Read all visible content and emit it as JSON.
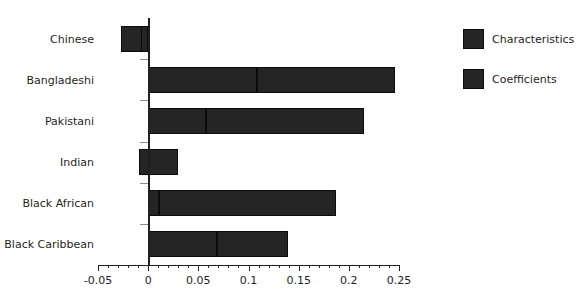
{
  "chart_data": {
    "type": "bar",
    "orientation": "horizontal",
    "stacked": true,
    "title": "",
    "xlabel": "",
    "ylabel": "",
    "xlim": [
      -0.05,
      0.25
    ],
    "grid": false,
    "categories": [
      "Chinese",
      "Bangladeshi",
      "Pakistani",
      "Indian",
      "Black African",
      "Black Caribbean"
    ],
    "xticks": [
      -0.05,
      0,
      0.05,
      0.1,
      0.15,
      0.2,
      0.25
    ],
    "xticklabels": [
      "-0.05",
      "0",
      "0.05",
      "0.1",
      "0.15",
      "0.2",
      "0.25"
    ],
    "minor_tick_step": 0.01,
    "series": [
      {
        "name": "Characteristics",
        "color": "#262525",
        "values": [
          -0.027,
          0.108,
          0.058,
          -0.009,
          0.011,
          0.069
        ]
      },
      {
        "name": "Coefficients",
        "color": "#262525",
        "values": [
          0.021,
          0.138,
          0.157,
          0.039,
          0.176,
          0.07
        ]
      }
    ],
    "totals": [
      -0.006,
      0.246,
      0.215,
      0.03,
      0.187,
      0.139
    ],
    "legend_position": "right"
  },
  "legend": {
    "items": [
      {
        "label": "Characteristics",
        "color": "#262525"
      },
      {
        "label": "Coefficients",
        "color": "#262525"
      }
    ]
  },
  "header": {
    "cut_off_title": ""
  }
}
